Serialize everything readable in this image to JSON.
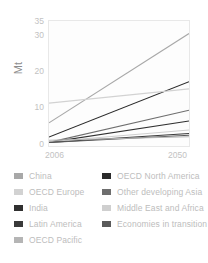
{
  "chart_data": {
    "type": "line",
    "title": "",
    "xlabel": "",
    "ylabel": "Mt",
    "xlim": [
      2006,
      2050
    ],
    "ylim": [
      0,
      35
    ],
    "x": [
      2006,
      2050
    ],
    "xticks": [
      "2006",
      "2050"
    ],
    "yticks": [
      "0",
      "10",
      "20",
      "30",
      "35"
    ],
    "ytick_values": [
      0,
      10,
      20,
      30,
      35
    ],
    "grid": false,
    "legend_position": "below",
    "series": [
      {
        "name": "China",
        "values": [
          6.5,
          31.5
        ],
        "color": "#a8a8a8"
      },
      {
        "name": "OECD North America",
        "values": [
          2.5,
          18.0
        ],
        "color": "#2b2b2b"
      },
      {
        "name": "OECD Europe",
        "values": [
          12.0,
          16.0
        ],
        "color": "#d2d2d2"
      },
      {
        "name": "Other developing Asia",
        "values": [
          1.0,
          10.0
        ],
        "color": "#6e6e6e"
      },
      {
        "name": "India",
        "values": [
          1.0,
          7.0
        ],
        "color": "#303030"
      },
      {
        "name": "Middle East and Africa",
        "values": [
          1.2,
          4.5
        ],
        "color": "#cfcfcf"
      },
      {
        "name": "Latin America",
        "values": [
          1.0,
          3.5
        ],
        "color": "#3a3a3a"
      },
      {
        "name": "Economies in transition",
        "values": [
          1.0,
          3.0
        ],
        "color": "#5a5a5a"
      },
      {
        "name": "OECD Pacific",
        "values": [
          1.6,
          2.6
        ],
        "color": "#b5b5b5"
      }
    ]
  },
  "axis": {
    "y_label": "Mt",
    "y_ticks": [
      "35",
      "30",
      "20",
      "10",
      "0"
    ],
    "x_tick_start": "2006",
    "x_tick_end": "2050"
  },
  "legend": {
    "column_one": [
      {
        "label": "China",
        "color": "#a8a8a8"
      },
      {
        "label": "OECD Europe",
        "color": "#d2d2d2"
      },
      {
        "label": "India",
        "color": "#303030"
      },
      {
        "label": "Latin America",
        "color": "#3a3a3a"
      },
      {
        "label": "OECD Pacific",
        "color": "#b5b5b5"
      }
    ],
    "column_two": [
      {
        "label": "OECD North America",
        "color": "#2b2b2b"
      },
      {
        "label": "Other developing Asia",
        "color": "#6e6e6e"
      },
      {
        "label": "Middle East and Africa",
        "color": "#cfcfcf"
      },
      {
        "label": "Economies in transition",
        "color": "#5a5a5a"
      }
    ]
  }
}
